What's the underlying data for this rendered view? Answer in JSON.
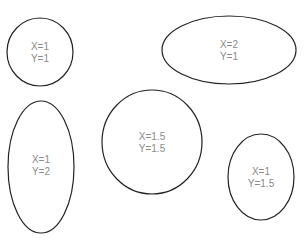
{
  "diagram": {
    "shapes": [
      {
        "id": "ellipse-1",
        "cx": 40,
        "cy": 52,
        "rx": 33,
        "ry": 34,
        "lines": [
          "X=1",
          "Y=1"
        ]
      },
      {
        "id": "ellipse-2",
        "cx": 229,
        "cy": 50,
        "rx": 67,
        "ry": 34,
        "lines": [
          "X=2",
          "Y=1"
        ]
      },
      {
        "id": "ellipse-3",
        "cx": 41,
        "cy": 167,
        "rx": 33,
        "ry": 66,
        "lines": [
          "X=1",
          "Y=2"
        ]
      },
      {
        "id": "ellipse-4",
        "cx": 152,
        "cy": 142,
        "rx": 50,
        "ry": 52,
        "lines": [
          "X=1.5",
          "Y=1.5"
        ]
      },
      {
        "id": "ellipse-5",
        "cx": 261,
        "cy": 177,
        "rx": 33,
        "ry": 43,
        "lines": [
          "X=1",
          "Y=1.5"
        ]
      }
    ],
    "stroke_color": "#222222",
    "label_color": "#8a8a8a"
  }
}
